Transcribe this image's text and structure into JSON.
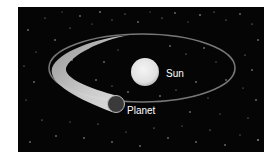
{
  "diagram": {
    "background_color": "#ffffff",
    "space_color": "#050505",
    "sun": {
      "label": "Sun",
      "color": "#e8e8e8"
    },
    "planet": {
      "label": "Planet",
      "color": "#3a3a3a",
      "rim_color": "#bdbdbd"
    },
    "orbit": {
      "color": "#8c8c8c",
      "trail_color": "#d0d0d0"
    }
  }
}
